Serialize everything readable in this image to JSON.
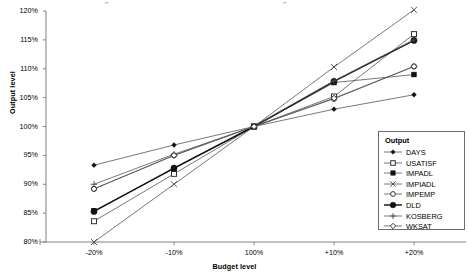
{
  "chart_data": {
    "type": "line",
    "title": "",
    "xlabel": "Budget level",
    "ylabel": "Output level",
    "categories": [
      "-20%",
      "-10%",
      "100%",
      "+10%",
      "+20%"
    ],
    "x": [
      -20,
      -10,
      0,
      10,
      20
    ],
    "ylim": [
      80,
      120
    ],
    "yticks": [
      "80%",
      "85%",
      "90%",
      "95%",
      "100%",
      "105%",
      "110%",
      "115%",
      "120%"
    ],
    "ytick_values": [
      80,
      85,
      90,
      95,
      100,
      105,
      110,
      115,
      120
    ],
    "grid": false,
    "legend_position": "right-inside",
    "legend_title": "Output",
    "series": [
      {
        "name": "DAYS",
        "marker": "filled-diamond",
        "values": [
          93.3,
          96.8,
          100,
          103.0,
          105.5
        ]
      },
      {
        "name": "USATISF",
        "marker": "open-square",
        "values": [
          83.6,
          91.8,
          100,
          105.2,
          116.0
        ]
      },
      {
        "name": "IMPADL",
        "marker": "filled-square",
        "values": [
          85.4,
          92.7,
          100,
          107.6,
          109.0
        ]
      },
      {
        "name": "IMPIADL",
        "marker": "cross-x",
        "values": [
          80.0,
          90.0,
          100,
          110.3,
          120.2
        ]
      },
      {
        "name": "IMPEMP",
        "marker": "open-circle",
        "values": [
          89.2,
          95.0,
          100,
          104.8,
          110.4
        ]
      },
      {
        "name": "DLD",
        "marker": "filled-circle",
        "values": [
          85.3,
          92.8,
          100,
          107.8,
          114.9
        ]
      },
      {
        "name": "KOSBERG",
        "marker": "plus",
        "values": [
          90.0,
          95.2,
          100,
          107.9,
          115.0
        ]
      },
      {
        "name": "WKSAT",
        "marker": "open-diamond",
        "values": [
          89.2,
          95.0,
          100,
          104.9,
          110.4
        ]
      }
    ]
  },
  "axes": {
    "y_title": "Output level",
    "x_title": "Budget level",
    "y_labels": [
      "120%",
      "115%",
      "110%",
      "105%",
      "100%",
      "95%",
      "90%",
      "85%",
      "80%"
    ],
    "x_labels": [
      "-20%",
      "-10%",
      "100%",
      "+10%",
      "+20%"
    ]
  },
  "legend": {
    "title": "Output",
    "items": [
      {
        "label": "DAYS",
        "marker": "filled-diamond"
      },
      {
        "label": "USATISF",
        "marker": "open-square"
      },
      {
        "label": "IMPADL",
        "marker": "filled-square"
      },
      {
        "label": "IMPIADL",
        "marker": "cross-x"
      },
      {
        "label": "IMPEMP",
        "marker": "open-circle"
      },
      {
        "label": "DLD",
        "marker": "filled-circle"
      },
      {
        "label": "KOSBERG",
        "marker": "plus"
      },
      {
        "label": "WKSAT",
        "marker": "open-diamond"
      }
    ]
  },
  "colors": {
    "line": "#555555",
    "axis": "#808080",
    "text": "#000000",
    "legend_border": "#6b6b6b",
    "background": "#ffffff"
  },
  "artifacts": {
    "top_left": "c",
    "top_mid": "c"
  }
}
